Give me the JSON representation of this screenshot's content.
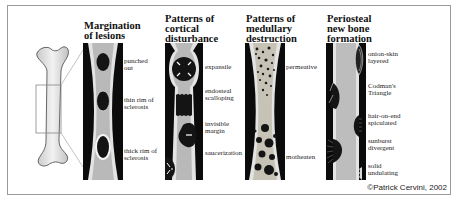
{
  "figure": {
    "bone_overview": "femur-with-selected-region",
    "panels": [
      {
        "title": "Margination of lesions",
        "labels": [
          "punched out",
          "thin rim of sclerosis",
          "thick rim of sclerosis"
        ]
      },
      {
        "title": "Patterns of cortical disturbance",
        "labels": [
          "expansile",
          "endosteal scalloping",
          "invisible margin",
          "saucerization"
        ]
      },
      {
        "title": "Patterns of medullary destruction",
        "labels": [
          "permeative",
          "motheaten"
        ]
      },
      {
        "title": "Periosteal new bone formation",
        "labels": [
          "onion-skin layered",
          "Codman's Triangle",
          "hair-on-end spiculated",
          "sunburst divergent",
          "solid undulating"
        ]
      }
    ],
    "copyright": "©Patrick Cervini, 2002"
  },
  "colors": {
    "panel_bg": "#0b0b0b",
    "bone_gray": "#bdbdbd",
    "cortex": "#e6e6e6",
    "lesion": "#111111",
    "frame": "#9a9a9a"
  }
}
